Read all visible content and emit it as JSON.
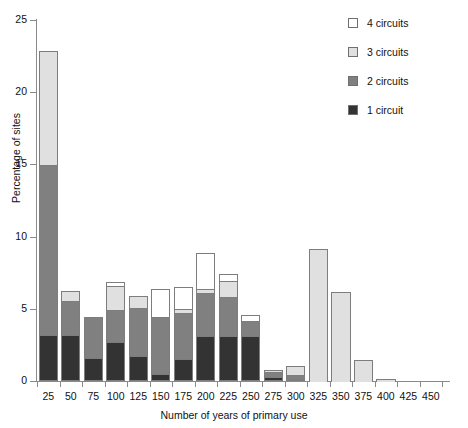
{
  "chart_data": {
    "type": "bar",
    "stacked": true,
    "title": "",
    "xlabel": "Number of years of primary use",
    "ylabel": "Percentage of sites",
    "categories": [
      "25",
      "50",
      "75",
      "100",
      "125",
      "150",
      "175",
      "200",
      "225",
      "250",
      "275",
      "300",
      "325",
      "350",
      "375",
      "400",
      "425",
      "450"
    ],
    "xtick_labels": [
      "25",
      "50",
      "75",
      "100",
      "125",
      "150",
      "175",
      "200",
      "225",
      "250",
      "275",
      "300",
      "325",
      "350",
      "375",
      "400",
      "425",
      "450"
    ],
    "ytick_labels": [
      "0",
      "5",
      "10",
      "15",
      "20",
      "25"
    ],
    "ytick_values": [
      0,
      5,
      10,
      15,
      20,
      25
    ],
    "ylim": [
      0,
      25
    ],
    "grid": false,
    "legend_position": "top-right",
    "series": [
      {
        "name": "1 circuit",
        "color": "#333333",
        "values": [
          3.2,
          3.2,
          1.6,
          2.7,
          1.7,
          0.5,
          1.5,
          3.1,
          3.1,
          3.1,
          0.3,
          0.15,
          0,
          0,
          0,
          0,
          0,
          0
        ]
      },
      {
        "name": "2 circuits",
        "color": "#808080",
        "values": [
          11.8,
          2.4,
          2.9,
          2.3,
          3.4,
          4.0,
          3.3,
          3.1,
          2.8,
          1.1,
          0.4,
          0.35,
          0,
          0,
          0,
          0,
          0,
          0
        ]
      },
      {
        "name": "3 circuits",
        "color": "#e0e0e0",
        "values": [
          8.0,
          0.8,
          0,
          1.7,
          0.9,
          0.1,
          0.3,
          0.3,
          1.2,
          0.1,
          0.2,
          0.7,
          9.2,
          6.2,
          1.5,
          0.2,
          0,
          0
        ]
      },
      {
        "name": "4 circuits",
        "color": "#ffffff",
        "values": [
          0,
          0,
          0,
          0.4,
          0,
          2.0,
          1.6,
          2.6,
          0.5,
          0.5,
          0,
          0,
          0,
          0,
          0,
          0,
          0,
          0
        ]
      }
    ],
    "bar_totals": [
      23.0,
      6.4,
      4.5,
      7.1,
      6.0,
      6.6,
      6.7,
      9.1,
      7.6,
      4.8,
      0.9,
      1.2,
      9.2,
      6.2,
      1.5,
      0.2,
      0,
      0
    ]
  },
  "legend": {
    "items": [
      {
        "label": "4 circuits",
        "color": "#ffffff"
      },
      {
        "label": "3 circuits",
        "color": "#e0e0e0"
      },
      {
        "label": "2 circuits",
        "color": "#808080"
      },
      {
        "label": "1 circuit",
        "color": "#333333"
      }
    ]
  }
}
